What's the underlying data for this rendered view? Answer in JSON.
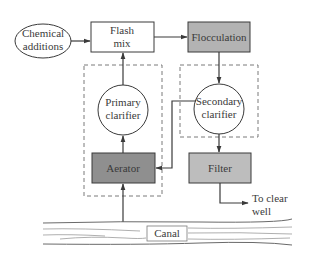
{
  "diagram": {
    "type": "process-flow",
    "colors": {
      "line": "#3a3a3a",
      "dashed": "#7a7a7a",
      "aerator_fill": "#8f8f8f",
      "flocculation_fill": "#b3b3b3",
      "filter_fill": "#bdbdbd",
      "canal_lines": "#6a6a6a"
    },
    "nodes": {
      "chemical_additions": {
        "line1": "Chemical",
        "line2": "additions",
        "shape": "ellipse"
      },
      "flash_mix": {
        "line1": "Flash",
        "line2": "mix",
        "shape": "rectangle"
      },
      "flocculation": {
        "label": "Flocculation",
        "shape": "rectangle-shaded"
      },
      "primary_clarifier": {
        "line1": "Primary",
        "line2": "clarifier",
        "shape": "circle"
      },
      "secondary_clarifier": {
        "line1": "Secondary",
        "line2": "clarifier",
        "shape": "circle"
      },
      "aerator": {
        "label": "Aerator",
        "shape": "rectangle-shaded-dark"
      },
      "filter": {
        "label": "Filter",
        "shape": "rectangle-shaded"
      },
      "canal": {
        "label": "Canal",
        "shape": "channel"
      },
      "clear_well": {
        "line1": "To clear",
        "line2": "well",
        "shape": "text"
      }
    },
    "edges": [
      {
        "from": "Chemical additions",
        "to": "Flash mix"
      },
      {
        "from": "Flash mix",
        "to": "Flocculation"
      },
      {
        "from": "Flocculation",
        "to": "Secondary clarifier"
      },
      {
        "from": "Secondary clarifier",
        "to": "Filter"
      },
      {
        "from": "Secondary clarifier",
        "to": "Aerator"
      },
      {
        "from": "Filter",
        "to": "To clear well"
      },
      {
        "from": "Canal",
        "to": "Aerator"
      },
      {
        "from": "Aerator",
        "to": "Primary clarifier"
      },
      {
        "from": "Primary clarifier",
        "to": "Flash mix"
      }
    ],
    "groups": [
      {
        "name": "primary-group",
        "members": [
          "Primary clarifier",
          "Aerator"
        ],
        "style": "dashed"
      },
      {
        "name": "secondary-group",
        "members": [
          "Secondary clarifier"
        ],
        "style": "dashed"
      }
    ]
  }
}
